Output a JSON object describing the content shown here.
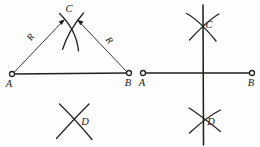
{
  "figure": {
    "background_color": "#fdfdfd",
    "ink_color": "#23211f",
    "panels": [
      {
        "name": "left-panel-arcs",
        "description": "Segment AB with compass arcs of radius R struck from A and B meeting at C above and D below",
        "segment": {
          "label_start": "A",
          "label_end": "B",
          "start_point": [
            12,
            74
          ],
          "end_point": [
            129,
            73
          ]
        },
        "radius_labels": [
          {
            "text": "R",
            "x": 33,
            "y": 39,
            "rotation": -54
          },
          {
            "text": "R",
            "x": 107,
            "y": 42,
            "rotation": 52
          }
        ],
        "intersection_labels": [
          {
            "text": "C",
            "x": 69,
            "y": 12
          },
          {
            "text": "D",
            "x": 85,
            "y": 125
          }
        ]
      },
      {
        "name": "right-panel-bisector",
        "description": "Segment AB with perpendicular bisector line drawn through intersection points C and D",
        "segment": {
          "label_start": "A",
          "label_end": "B",
          "start_point": [
            143,
            73
          ],
          "end_point": [
            252,
            73
          ]
        },
        "intersection_labels": [
          {
            "text": "C",
            "x": 209,
            "y": 28
          },
          {
            "text": "D",
            "x": 211,
            "y": 125
          }
        ],
        "bisector": {
          "x": 203,
          "y_top": 5,
          "y_bottom": 145
        }
      }
    ]
  }
}
